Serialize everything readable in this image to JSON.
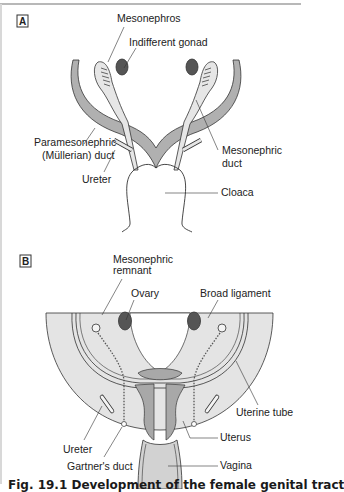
{
  "figure": {
    "caption": "Fig. 19.1   Development of the female genital tract",
    "colors": {
      "duct_fill": "#b0b0b0",
      "gonad_fill": "#555555",
      "ligament_fill": "#e4e4e4",
      "uterus_fill": "#a8a8a8",
      "vagina_fill": "#d2d2d2",
      "line": "#333333"
    }
  },
  "panel_a": {
    "label": "A",
    "labels": {
      "mesonephros": "Mesonephros",
      "indifferent_gonad": "Indifferent gonad",
      "paramesonephric_1": "Paramesonephric",
      "paramesonephric_2": "(Müllerian) duct",
      "mesonephric_duct_1": "Mesonephric",
      "mesonephric_duct_2": "duct",
      "ureter": "Ureter",
      "cloaca": "Cloaca"
    }
  },
  "panel_b": {
    "label": "B",
    "labels": {
      "mesonephric_remnant_1": "Mesonephric",
      "mesonephric_remnant_2": "remnant",
      "ovary": "Ovary",
      "broad_ligament": "Broad ligament",
      "uterine_tube": "Uterine tube",
      "ureter": "Ureter",
      "uterus": "Uterus",
      "gartners_duct": "Gartner's duct",
      "vagina": "Vagina"
    }
  }
}
